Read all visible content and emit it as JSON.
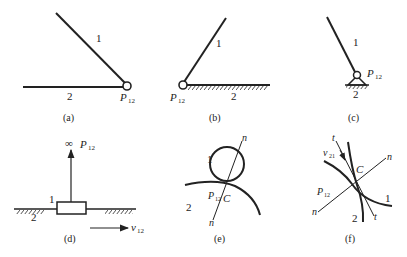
{
  "figure": {
    "panels": [
      {
        "id": "a",
        "caption": "(a)",
        "link1": "1",
        "link2": "2",
        "pole": "P",
        "pole_sub": "12"
      },
      {
        "id": "b",
        "caption": "(b)",
        "link1": "1",
        "link2": "2",
        "pole": "P",
        "pole_sub": "12"
      },
      {
        "id": "c",
        "caption": "(c)",
        "link1": "1",
        "link2": "2",
        "pole": "P",
        "pole_sub": "12"
      },
      {
        "id": "d",
        "caption": "(d)",
        "link1": "1",
        "link2": "2",
        "infinity": "∞",
        "pole": "P",
        "pole_sub": "12",
        "velocity": "v",
        "velocity_sub": "12"
      },
      {
        "id": "e",
        "caption": "(e)",
        "link1": "1",
        "link2": "2",
        "normal": "n",
        "pole": "P",
        "pole_sub": "12",
        "contact": "C"
      },
      {
        "id": "f",
        "caption": "(f)",
        "link1": "1",
        "link2": "2",
        "normal": "n",
        "tangent": "t",
        "pole": "P",
        "pole_sub": "12",
        "contact": "C",
        "velocity": "v",
        "velocity_sub": "21"
      }
    ]
  }
}
